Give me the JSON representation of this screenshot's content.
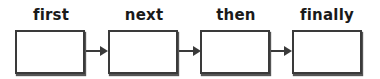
{
  "steps": [
    {
      "label": "first"
    },
    {
      "label": "next"
    },
    {
      "label": "then"
    },
    {
      "label": "finally"
    }
  ],
  "colors": {
    "stroke": "#3a3a3a",
    "text": "#1a1a1a",
    "background": "#ffffff"
  }
}
